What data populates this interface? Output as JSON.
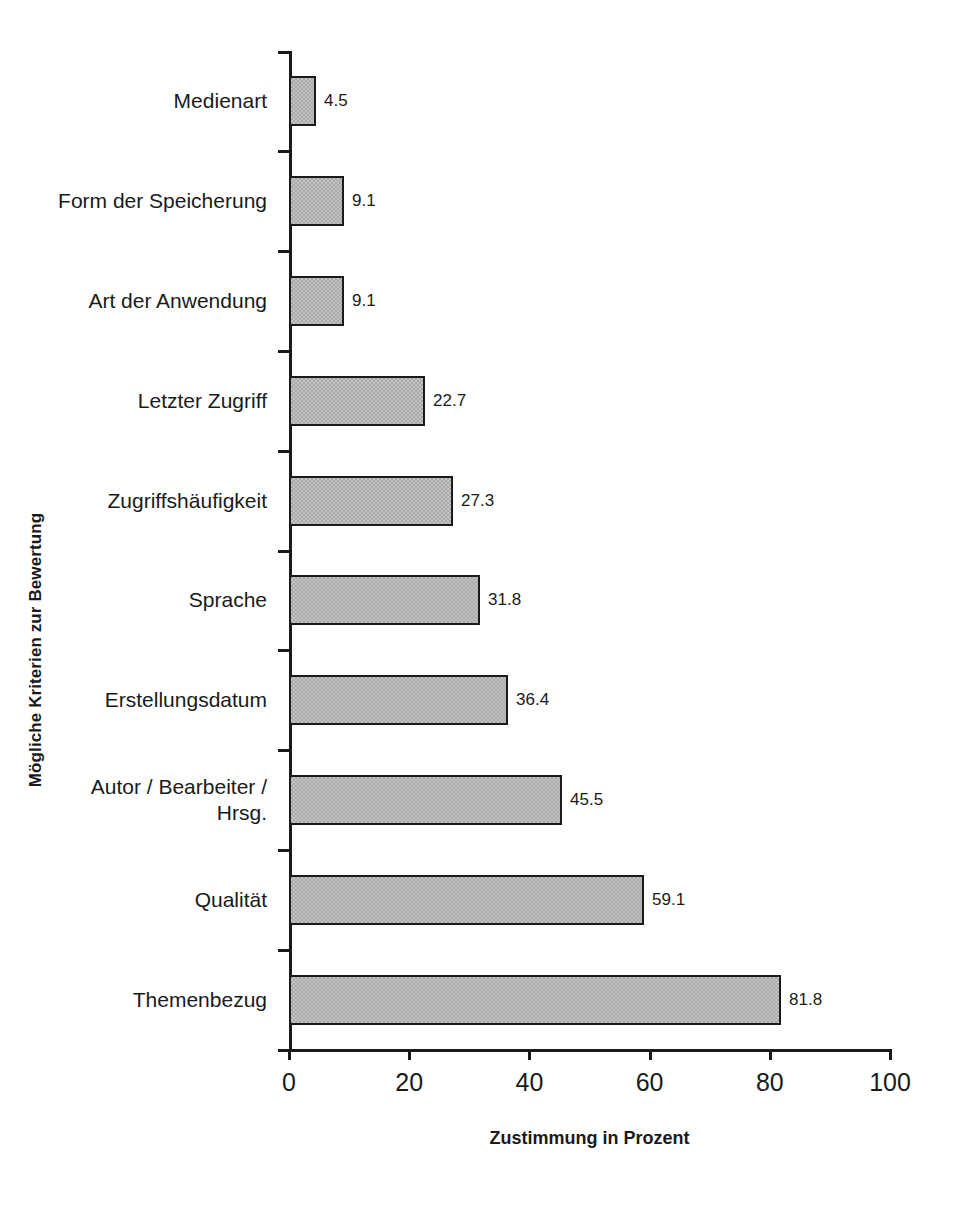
{
  "chart_data": {
    "type": "bar",
    "orientation": "horizontal",
    "title": "",
    "xlabel": "Zustimmung in Prozent",
    "ylabel": "Mögliche Kriterien zur Bewertung",
    "xlim": [
      0,
      100
    ],
    "xticks": [
      "0",
      "20",
      "40",
      "60",
      "80",
      "100"
    ],
    "grid": false,
    "legend": null,
    "categories": [
      "Medienart",
      "Form der Speicherung",
      "Art der Anwendung",
      "Letzter Zugriff",
      "Zugriffshäufigkeit",
      "Sprache",
      "Erstellungsdatum",
      "Autor / Bearbeiter /\nHrsg.",
      "Qualität",
      "Themenbezug"
    ],
    "values": [
      4.5,
      9.1,
      9.1,
      22.7,
      27.3,
      31.8,
      36.4,
      45.5,
      59.1,
      81.8
    ],
    "value_labels": [
      "4.5",
      "9.1",
      "9.1",
      "22.7",
      "27.3",
      "31.8",
      "36.4",
      "45.5",
      "59.1",
      "81.8"
    ],
    "colors": {
      "bar_fill": "#a9a9a9",
      "bar_border": "#1a1a1a",
      "axis": "#1a1a1a",
      "background": "#ffffff",
      "text": "#1a1a1a"
    }
  }
}
